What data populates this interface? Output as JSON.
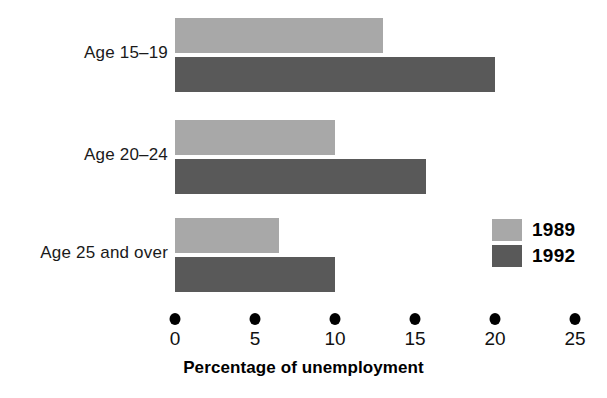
{
  "chart_data": {
    "type": "bar",
    "orientation": "horizontal",
    "title": "",
    "xlabel": "Percentage of unemployment",
    "ylabel": "",
    "categories": [
      "Age 15–19",
      "Age 20–24",
      "Age 25 and over"
    ],
    "series": [
      {
        "name": "1989",
        "color": "#a8a8a8",
        "values": [
          13.0,
          10.0,
          6.5
        ]
      },
      {
        "name": "1992",
        "color": "#595959",
        "values": [
          20.0,
          15.7,
          10.0
        ]
      }
    ],
    "xlim": [
      0,
      25
    ],
    "xticks": [
      0,
      5,
      10,
      15,
      20,
      25
    ],
    "xtick_labels": [
      "0",
      "5",
      "10",
      "15",
      "20",
      "25"
    ],
    "grid": false,
    "legend_position": "right"
  },
  "axis": {
    "title": "Percentage of unemployment",
    "ticks": [
      {
        "label": "0",
        "value": 0
      },
      {
        "label": "5",
        "value": 5
      },
      {
        "label": "10",
        "value": 10
      },
      {
        "label": "15",
        "value": 15
      },
      {
        "label": "20",
        "value": 20
      },
      {
        "label": "25",
        "value": 25
      }
    ]
  },
  "legend": {
    "items": [
      {
        "label": "1989",
        "color": "#a8a8a8"
      },
      {
        "label": "1992",
        "color": "#595959"
      }
    ]
  },
  "groups": [
    {
      "label": "Age 15–19",
      "bars": [
        {
          "series": "1989",
          "value": 13.0
        },
        {
          "series": "1992",
          "value": 20.0
        }
      ]
    },
    {
      "label": "Age 20–24",
      "bars": [
        {
          "series": "1989",
          "value": 10.0
        },
        {
          "series": "1992",
          "value": 15.7
        }
      ]
    },
    {
      "label": "Age 25 and over",
      "bars": [
        {
          "series": "1989",
          "value": 6.5
        },
        {
          "series": "1992",
          "value": 10.0
        }
      ]
    }
  ],
  "layout": {
    "origin_x": 175,
    "px_per_unit": 16,
    "tick_row_y": 313,
    "tick_label_y": 328,
    "axis_title_y": 358,
    "group_tops": [
      18,
      120,
      218
    ],
    "bar_height": 35,
    "bar_gap": 4
  }
}
